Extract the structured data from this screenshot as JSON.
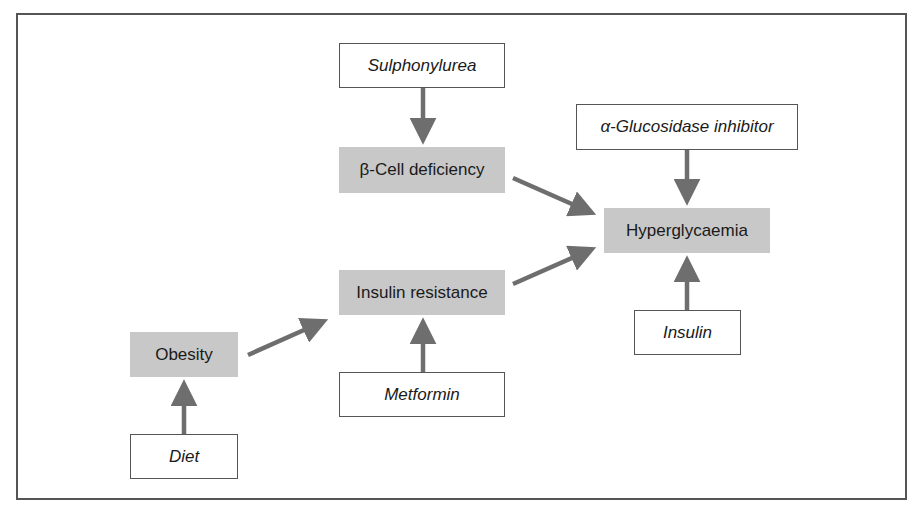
{
  "diagram": {
    "colors": {
      "condition_fill": "#c8c8c8",
      "treatment_fill": "#ffffff",
      "arrow": "#6e6e6e",
      "border": "#555555"
    },
    "nodes": {
      "sulphonylurea": {
        "label": "Sulphonylurea",
        "type": "treatment"
      },
      "beta_cell": {
        "label": "β-Cell deficiency",
        "type": "condition"
      },
      "alpha_glucosidase": {
        "label": "α-Glucosidase inhibitor",
        "type": "treatment"
      },
      "hyperglycaemia": {
        "label": "Hyperglycaemia",
        "type": "condition"
      },
      "insulin_resistance": {
        "label": "Insulin resistance",
        "type": "condition"
      },
      "metformin": {
        "label": "Metformin",
        "type": "treatment"
      },
      "obesity": {
        "label": "Obesity",
        "type": "condition"
      },
      "diet": {
        "label": "Diet",
        "type": "treatment"
      },
      "insulin": {
        "label": "Insulin",
        "type": "treatment"
      }
    },
    "edges": [
      {
        "from": "sulphonylurea",
        "to": "beta_cell"
      },
      {
        "from": "beta_cell",
        "to": "hyperglycaemia"
      },
      {
        "from": "alpha_glucosidase",
        "to": "hyperglycaemia"
      },
      {
        "from": "insulin_resistance",
        "to": "hyperglycaemia"
      },
      {
        "from": "insulin",
        "to": "hyperglycaemia"
      },
      {
        "from": "metformin",
        "to": "insulin_resistance"
      },
      {
        "from": "obesity",
        "to": "insulin_resistance"
      },
      {
        "from": "diet",
        "to": "obesity"
      }
    ]
  }
}
